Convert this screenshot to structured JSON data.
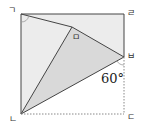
{
  "diagram": {
    "type": "folded-square-geometry",
    "colors": {
      "light_fill": "#ececec",
      "dark_fill": "#d9d9d9",
      "stroke": "#444444",
      "dashed": "#888888"
    },
    "vertices": {
      "g": {
        "label": "ㄱ",
        "x": 21,
        "y": 14
      },
      "n": {
        "label": "ㄴ",
        "x": 21,
        "y": 114
      },
      "d": {
        "label": "ㄷ",
        "x": 124,
        "y": 114
      },
      "r": {
        "label": "ㄹ",
        "x": 124,
        "y": 14
      },
      "m": {
        "label": "ㅁ",
        "x": 72,
        "y": 27
      },
      "b": {
        "label": "ㅂ",
        "x": 124,
        "y": 57
      }
    },
    "angle_label": "60°"
  }
}
